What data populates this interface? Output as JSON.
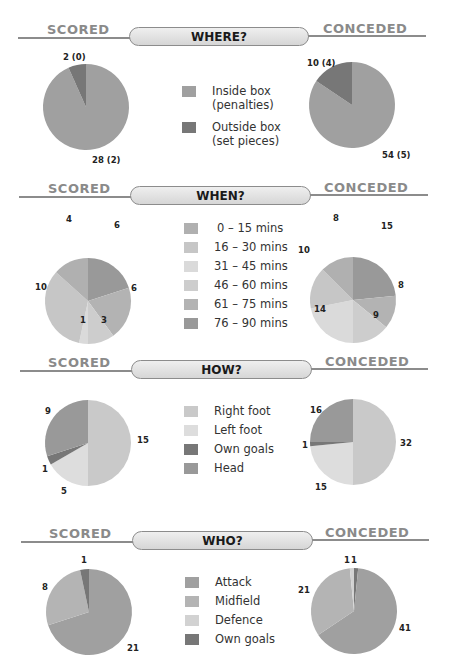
{
  "page_title_fragment": "",
  "labels": {
    "scored": "SCORED",
    "conceded": "CONCEDED"
  },
  "sections": {
    "where": {
      "title": "WHERE?",
      "legend": [
        {
          "label": "Inside box\n(penalties)",
          "line1": "Inside box",
          "line2": "(penalties)",
          "color": "#a0a0a0"
        },
        {
          "label": "Outside box\n(set pieces)",
          "line1": "Outside box",
          "line2": "(set pieces)",
          "color": "#777777"
        }
      ],
      "scored_labels": {
        "outside": "2 (0)",
        "inside": "28 (2)"
      },
      "conceded_labels": {
        "outside": "10 (4)",
        "inside": "54 (5)"
      }
    },
    "when": {
      "title": "WHEN?",
      "legend": [
        {
          "label": "0 – 15 mins",
          "color": "#b0b0b0"
        },
        {
          "label": "16 – 30 mins",
          "color": "#c6c6c6"
        },
        {
          "label": "31 – 45 mins",
          "color": "#dadada"
        },
        {
          "label": "46 – 60 mins",
          "color": "#cdcdcd"
        },
        {
          "label": "61 – 75 mins",
          "color": "#b3b3b3"
        },
        {
          "label": "76 – 90 mins",
          "color": "#999999"
        }
      ]
    },
    "how": {
      "title": "HOW?",
      "legend": [
        {
          "label": "Right foot",
          "color": "#c9c9c9"
        },
        {
          "label": "Left foot",
          "color": "#dddddd"
        },
        {
          "label": "Own goals",
          "color": "#777777"
        },
        {
          "label": "Head",
          "color": "#999999"
        }
      ]
    },
    "who": {
      "title": "WHO?",
      "legend": [
        {
          "label": "Attack",
          "color": "#a0a0a0"
        },
        {
          "label": "Midfield",
          "color": "#b4b4b4"
        },
        {
          "label": "Defence",
          "color": "#d2d2d2"
        },
        {
          "label": "Own goals",
          "color": "#777777"
        }
      ]
    }
  },
  "chart_data": [
    {
      "type": "pie",
      "title": "WHERE? — Scored",
      "categories": [
        "Inside box (penalties)",
        "Outside box (set pieces)"
      ],
      "values": [
        28,
        2
      ],
      "penalties_in_parentheses": [
        2,
        0
      ],
      "data_labels": [
        "28 (2)",
        "2 (0)"
      ]
    },
    {
      "type": "pie",
      "title": "WHERE? — Conceded",
      "categories": [
        "Inside box (penalties)",
        "Outside box (set pieces)"
      ],
      "values": [
        54,
        10
      ],
      "penalties_in_parentheses": [
        5,
        4
      ],
      "data_labels": [
        "54 (5)",
        "10 (4)"
      ]
    },
    {
      "type": "pie",
      "title": "WHEN? — Scored",
      "categories": [
        "0 – 15 mins",
        "16 – 30 mins",
        "31 – 45 mins",
        "46 – 60 mins",
        "61 – 75 mins",
        "76 – 90 mins"
      ],
      "values": [
        4,
        10,
        1,
        3,
        6,
        6
      ]
    },
    {
      "type": "pie",
      "title": "WHEN? — Conceded",
      "categories": [
        "0 – 15 mins",
        "16 – 30 mins",
        "31 – 45 mins",
        "46 – 60 mins",
        "61 – 75 mins",
        "76 – 90 mins"
      ],
      "values": [
        8,
        10,
        14,
        9,
        8,
        15
      ]
    },
    {
      "type": "pie",
      "title": "HOW? — Scored",
      "categories": [
        "Right foot",
        "Left foot",
        "Own goals",
        "Head"
      ],
      "values": [
        15,
        5,
        1,
        9
      ]
    },
    {
      "type": "pie",
      "title": "HOW? — Conceded",
      "categories": [
        "Right foot",
        "Left foot",
        "Own goals",
        "Head"
      ],
      "values": [
        32,
        15,
        1,
        16
      ]
    },
    {
      "type": "pie",
      "title": "WHO? — Scored",
      "categories": [
        "Attack",
        "Midfield",
        "Defence",
        "Own goals"
      ],
      "values": [
        21,
        8,
        0,
        1
      ]
    },
    {
      "type": "pie",
      "title": "WHO? — Conceded",
      "categories": [
        "Attack",
        "Midfield",
        "Defence",
        "Own goals"
      ],
      "values": [
        41,
        21,
        1,
        1
      ]
    }
  ]
}
